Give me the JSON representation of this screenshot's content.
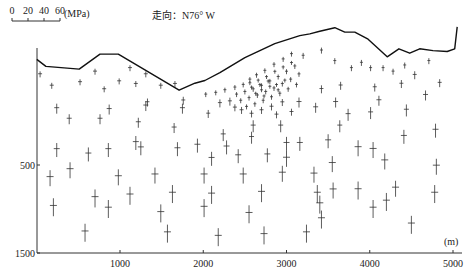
{
  "chart_data": {
    "type": "scatter",
    "title": "",
    "strike_label": "走向：N76° W",
    "scale_bar": {
      "ticks": [
        "0",
        "20",
        "40",
        "60"
      ],
      "unit": "(MPa)",
      "max": 60
    },
    "xlabel": "(m)",
    "ylabel": "",
    "x_ticks": [
      1000,
      2000,
      3000,
      4000,
      5000
    ],
    "x_tick_labels": [
      "1000",
      "2000",
      "3000",
      "4000",
      "5000"
    ],
    "y_ticks": [
      500,
      1500
    ],
    "y_tick_labels": [
      "500",
      "1500"
    ],
    "xlim": [
      0,
      5150
    ],
    "ylim": [
      -830,
      1500
    ],
    "topography": [
      [
        0,
        -700
      ],
      [
        110,
        -620
      ],
      [
        510,
        -590
      ],
      [
        760,
        -760
      ],
      [
        980,
        -760
      ],
      [
        1710,
        -350
      ],
      [
        1900,
        -430
      ],
      [
        2020,
        -460
      ],
      [
        2200,
        -550
      ],
      [
        2500,
        -720
      ],
      [
        2860,
        -880
      ],
      [
        3160,
        -970
      ],
      [
        3280,
        -990
      ],
      [
        3400,
        -1020
      ],
      [
        3580,
        -1060
      ],
      [
        3700,
        -1010
      ],
      [
        3820,
        -1010
      ],
      [
        3980,
        -930
      ],
      [
        4210,
        -730
      ],
      [
        4350,
        -820
      ],
      [
        4480,
        -770
      ],
      [
        4600,
        -820
      ],
      [
        4760,
        -800
      ],
      [
        4930,
        -790
      ],
      [
        5020,
        -820
      ],
      [
        5050,
        -1070
      ]
    ],
    "stress_crosses": [
      {
        "x": 40,
        "y": -530,
        "v": 6,
        "h": 4
      },
      {
        "x": 180,
        "y": -400,
        "v": 6,
        "h": 4
      },
      {
        "x": 520,
        "y": -440,
        "v": 6,
        "h": 4
      },
      {
        "x": 810,
        "y": -360,
        "v": 6,
        "h": 4
      },
      {
        "x": 990,
        "y": -450,
        "v": 6,
        "h": 4
      },
      {
        "x": 1190,
        "y": -420,
        "v": 6,
        "h": 4
      },
      {
        "x": 1490,
        "y": -400,
        "v": 6,
        "h": 4
      },
      {
        "x": 1660,
        "y": -420,
        "v": 6,
        "h": 4
      },
      {
        "x": 1310,
        "y": -530,
        "v": 6,
        "h": 4
      },
      {
        "x": 1120,
        "y": -600,
        "v": 6,
        "h": 4
      },
      {
        "x": 700,
        "y": -560,
        "v": 6,
        "h": 4
      },
      {
        "x": 240,
        "y": -140,
        "v": 10,
        "h": 5
      },
      {
        "x": 870,
        "y": -130,
        "v": 10,
        "h": 5
      },
      {
        "x": 1310,
        "y": -170,
        "v": 10,
        "h": 5
      },
      {
        "x": 1750,
        "y": -140,
        "v": 10,
        "h": 5
      },
      {
        "x": 390,
        "y": -20,
        "v": 10,
        "h": 5
      },
      {
        "x": 760,
        "y": -20,
        "v": 10,
        "h": 5
      },
      {
        "x": 1220,
        "y": 20,
        "v": 10,
        "h": 5
      },
      {
        "x": 1650,
        "y": 80,
        "v": 10,
        "h": 5
      },
      {
        "x": 1330,
        "y": -210,
        "v": 8,
        "h": 4
      },
      {
        "x": 1760,
        "y": -230,
        "v": 8,
        "h": 4
      },
      {
        "x": 2060,
        "y": -80,
        "v": 8,
        "h": 4
      },
      {
        "x": 2200,
        "y": -200,
        "v": 8,
        "h": 4
      },
      {
        "x": 2320,
        "y": -220,
        "v": 8,
        "h": 4
      },
      {
        "x": 240,
        "y": 330,
        "v": 14,
        "h": 6
      },
      {
        "x": 860,
        "y": 330,
        "v": 14,
        "h": 6
      },
      {
        "x": 1250,
        "y": 310,
        "v": 14,
        "h": 6
      },
      {
        "x": 1690,
        "y": 320,
        "v": 14,
        "h": 6
      },
      {
        "x": 1190,
        "y": 250,
        "v": 14,
        "h": 6
      },
      {
        "x": 620,
        "y": 380,
        "v": 14,
        "h": 6
      },
      {
        "x": 1930,
        "y": 280,
        "v": 14,
        "h": 6
      },
      {
        "x": 2280,
        "y": 300,
        "v": 14,
        "h": 6
      },
      {
        "x": 400,
        "y": 560,
        "v": 16,
        "h": 7
      },
      {
        "x": 2100,
        "y": 430,
        "v": 14,
        "h": 6
      },
      {
        "x": 2420,
        "y": 400,
        "v": 14,
        "h": 6
      },
      {
        "x": 2770,
        "y": 390,
        "v": 14,
        "h": 6
      },
      {
        "x": 3000,
        "y": 260,
        "v": 14,
        "h": 6
      },
      {
        "x": 3160,
        "y": 260,
        "v": 14,
        "h": 6
      },
      {
        "x": 3500,
        "y": 230,
        "v": 14,
        "h": 6
      },
      {
        "x": 2580,
        "y": 190,
        "v": 12,
        "h": 5
      },
      {
        "x": 2240,
        "y": 160,
        "v": 12,
        "h": 5
      },
      {
        "x": 2600,
        "y": 60,
        "v": 12,
        "h": 5
      },
      {
        "x": 2930,
        "y": 60,
        "v": 12,
        "h": 5
      },
      {
        "x": 3640,
        "y": 60,
        "v": 12,
        "h": 5
      },
      {
        "x": 3740,
        "y": -70,
        "v": 12,
        "h": 5
      },
      {
        "x": 4010,
        "y": -90,
        "v": 12,
        "h": 5
      },
      {
        "x": 4440,
        "y": -120,
        "v": 12,
        "h": 5
      },
      {
        "x": 3150,
        "y": -210,
        "v": 10,
        "h": 5
      },
      {
        "x": 3350,
        "y": -150,
        "v": 10,
        "h": 5
      },
      {
        "x": 3590,
        "y": -210,
        "v": 10,
        "h": 5
      },
      {
        "x": 4110,
        "y": -230,
        "v": 10,
        "h": 5
      },
      {
        "x": 4670,
        "y": -290,
        "v": 10,
        "h": 5
      },
      {
        "x": 3420,
        "y": -360,
        "v": 8,
        "h": 4
      },
      {
        "x": 3650,
        "y": -400,
        "v": 8,
        "h": 4
      },
      {
        "x": 4060,
        "y": -380,
        "v": 8,
        "h": 4
      },
      {
        "x": 4380,
        "y": -420,
        "v": 8,
        "h": 4
      },
      {
        "x": 4540,
        "y": -520,
        "v": 8,
        "h": 4
      },
      {
        "x": 4840,
        "y": -430,
        "v": 8,
        "h": 4
      },
      {
        "x": 3200,
        "y": -740,
        "v": 6,
        "h": 3
      },
      {
        "x": 3420,
        "y": -800,
        "v": 6,
        "h": 3
      },
      {
        "x": 3580,
        "y": -680,
        "v": 6,
        "h": 3
      },
      {
        "x": 3780,
        "y": -600,
        "v": 6,
        "h": 3
      },
      {
        "x": 3900,
        "y": -660,
        "v": 6,
        "h": 3
      },
      {
        "x": 4010,
        "y": -600,
        "v": 6,
        "h": 3
      },
      {
        "x": 4160,
        "y": -600,
        "v": 6,
        "h": 3
      },
      {
        "x": 4280,
        "y": -560,
        "v": 6,
        "h": 3
      },
      {
        "x": 4420,
        "y": -630,
        "v": 6,
        "h": 3
      },
      {
        "x": 4710,
        "y": -680,
        "v": 6,
        "h": 3
      },
      {
        "x": 2030,
        "y": -300,
        "v": 5,
        "h": 3
      },
      {
        "x": 2150,
        "y": -320,
        "v": 5,
        "h": 3
      },
      {
        "x": 2260,
        "y": -350,
        "v": 5,
        "h": 3
      },
      {
        "x": 2380,
        "y": -380,
        "v": 5,
        "h": 3
      },
      {
        "x": 2480,
        "y": -410,
        "v": 5,
        "h": 3
      },
      {
        "x": 2560,
        "y": -470,
        "v": 5,
        "h": 3
      },
      {
        "x": 2640,
        "y": -520,
        "v": 5,
        "h": 3
      },
      {
        "x": 2740,
        "y": -570,
        "v": 5,
        "h": 3
      },
      {
        "x": 2850,
        "y": -640,
        "v": 5,
        "h": 3
      },
      {
        "x": 2960,
        "y": -700,
        "v": 5,
        "h": 3
      },
      {
        "x": 3060,
        "y": -760,
        "v": 5,
        "h": 3
      },
      {
        "x": 2400,
        "y": -300,
        "v": 5,
        "h": 3
      },
      {
        "x": 2500,
        "y": -330,
        "v": 5,
        "h": 3
      },
      {
        "x": 2600,
        "y": -360,
        "v": 5,
        "h": 3
      },
      {
        "x": 2700,
        "y": -400,
        "v": 5,
        "h": 3
      },
      {
        "x": 2800,
        "y": -450,
        "v": 5,
        "h": 3
      },
      {
        "x": 2900,
        "y": -500,
        "v": 5,
        "h": 3
      },
      {
        "x": 3000,
        "y": -560,
        "v": 5,
        "h": 3
      },
      {
        "x": 3100,
        "y": -620,
        "v": 5,
        "h": 3
      },
      {
        "x": 2450,
        "y": -230,
        "v": 5,
        "h": 3
      },
      {
        "x": 2550,
        "y": -260,
        "v": 5,
        "h": 3
      },
      {
        "x": 2650,
        "y": -290,
        "v": 5,
        "h": 3
      },
      {
        "x": 2750,
        "y": -330,
        "v": 5,
        "h": 3
      },
      {
        "x": 2850,
        "y": -370,
        "v": 5,
        "h": 3
      },
      {
        "x": 2950,
        "y": -420,
        "v": 5,
        "h": 3
      },
      {
        "x": 3050,
        "y": -470,
        "v": 5,
        "h": 3
      },
      {
        "x": 3150,
        "y": -530,
        "v": 5,
        "h": 3
      },
      {
        "x": 2520,
        "y": -160,
        "v": 5,
        "h": 3
      },
      {
        "x": 2620,
        "y": -190,
        "v": 5,
        "h": 3
      },
      {
        "x": 2720,
        "y": -230,
        "v": 5,
        "h": 3
      },
      {
        "x": 2820,
        "y": -270,
        "v": 5,
        "h": 3
      },
      {
        "x": 2920,
        "y": -310,
        "v": 5,
        "h": 3
      },
      {
        "x": 3020,
        "y": -360,
        "v": 5,
        "h": 3
      },
      {
        "x": 3120,
        "y": -410,
        "v": 5,
        "h": 3
      },
      {
        "x": 2560,
        "y": -430,
        "v": 4,
        "h": 3
      },
      {
        "x": 2660,
        "y": -460,
        "v": 4,
        "h": 3
      },
      {
        "x": 2760,
        "y": -500,
        "v": 4,
        "h": 3
      },
      {
        "x": 2860,
        "y": -560,
        "v": 4,
        "h": 3
      },
      {
        "x": 2960,
        "y": -610,
        "v": 4,
        "h": 3
      },
      {
        "x": 3060,
        "y": -660,
        "v": 4,
        "h": 3
      },
      {
        "x": 2580,
        "y": -380,
        "v": 4,
        "h": 3
      },
      {
        "x": 2680,
        "y": -410,
        "v": 4,
        "h": 3
      },
      {
        "x": 2780,
        "y": -450,
        "v": 4,
        "h": 3
      },
      {
        "x": 2880,
        "y": -410,
        "v": 4,
        "h": 3
      },
      {
        "x": 2980,
        "y": -460,
        "v": 4,
        "h": 3
      },
      {
        "x": 2700,
        "y": -350,
        "v": 4,
        "h": 3
      },
      {
        "x": 2800,
        "y": -390,
        "v": 4,
        "h": 3
      },
      {
        "x": 2900,
        "y": -350,
        "v": 4,
        "h": 3
      },
      {
        "x": 2630,
        "y": -310,
        "v": 4,
        "h": 3
      },
      {
        "x": 2730,
        "y": -280,
        "v": 4,
        "h": 3
      },
      {
        "x": 2460,
        "y": -120,
        "v": 7,
        "h": 4
      },
      {
        "x": 2580,
        "y": -80,
        "v": 7,
        "h": 4
      },
      {
        "x": 2700,
        "y": -120,
        "v": 7,
        "h": 4
      },
      {
        "x": 2820,
        "y": -160,
        "v": 7,
        "h": 4
      },
      {
        "x": 2950,
        "y": -210,
        "v": 7,
        "h": 4
      },
      {
        "x": 2880,
        "y": -70,
        "v": 7,
        "h": 4
      },
      {
        "x": 3060,
        "y": -100,
        "v": 7,
        "h": 4
      },
      {
        "x": 2380,
        "y": -150,
        "v": 7,
        "h": 4
      },
      {
        "x": 200,
        "y": 980,
        "v": 18,
        "h": 7
      },
      {
        "x": 700,
        "y": 880,
        "v": 18,
        "h": 7
      },
      {
        "x": 1120,
        "y": 850,
        "v": 18,
        "h": 7
      },
      {
        "x": 1630,
        "y": 830,
        "v": 18,
        "h": 7
      },
      {
        "x": 2100,
        "y": 840,
        "v": 18,
        "h": 7
      },
      {
        "x": 2700,
        "y": 820,
        "v": 18,
        "h": 7
      },
      {
        "x": 3370,
        "y": 830,
        "v": 18,
        "h": 7
      },
      {
        "x": 3860,
        "y": 790,
        "v": 18,
        "h": 7
      },
      {
        "x": 4780,
        "y": 830,
        "v": 18,
        "h": 7
      },
      {
        "x": 860,
        "y": 1000,
        "v": 18,
        "h": 7
      },
      {
        "x": 1490,
        "y": 1050,
        "v": 18,
        "h": 7
      },
      {
        "x": 2010,
        "y": 990,
        "v": 18,
        "h": 7
      },
      {
        "x": 3400,
        "y": 950,
        "v": 18,
        "h": 7
      },
      {
        "x": 4200,
        "y": 920,
        "v": 18,
        "h": 7
      },
      {
        "x": 2550,
        "y": 1060,
        "v": 18,
        "h": 7
      },
      {
        "x": 580,
        "y": 1270,
        "v": 18,
        "h": 7
      },
      {
        "x": 1570,
        "y": 1280,
        "v": 18,
        "h": 7
      },
      {
        "x": 2180,
        "y": 1320,
        "v": 18,
        "h": 7
      },
      {
        "x": 2730,
        "y": 1300,
        "v": 18,
        "h": 7
      },
      {
        "x": 3240,
        "y": 1280,
        "v": 18,
        "h": 7
      },
      {
        "x": 3420,
        "y": 1120,
        "v": 18,
        "h": 7
      },
      {
        "x": 4040,
        "y": 1000,
        "v": 18,
        "h": 7
      },
      {
        "x": 4500,
        "y": 1180,
        "v": 18,
        "h": 7
      },
      {
        "x": 4800,
        "y": 520,
        "v": 16,
        "h": 7
      },
      {
        "x": 4790,
        "y": 110,
        "v": 14,
        "h": 6
      },
      {
        "x": 3860,
        "y": 310,
        "v": 16,
        "h": 7
      },
      {
        "x": 4040,
        "y": 330,
        "v": 16,
        "h": 7
      },
      {
        "x": 4410,
        "y": 180,
        "v": 14,
        "h": 6
      },
      {
        "x": 3550,
        "y": 490,
        "v": 16,
        "h": 7
      },
      {
        "x": 3560,
        "y": 790,
        "v": 16,
        "h": 7
      },
      {
        "x": 4310,
        "y": 770,
        "v": 16,
        "h": 7
      },
      {
        "x": 3330,
        "y": 610,
        "v": 16,
        "h": 7
      },
      {
        "x": 2950,
        "y": 600,
        "v": 16,
        "h": 7
      },
      {
        "x": 2480,
        "y": 620,
        "v": 16,
        "h": 7
      },
      {
        "x": 2010,
        "y": 620,
        "v": 16,
        "h": 7
      },
      {
        "x": 1420,
        "y": 620,
        "v": 16,
        "h": 7
      },
      {
        "x": 980,
        "y": 640,
        "v": 16,
        "h": 7
      },
      {
        "x": 160,
        "y": 650,
        "v": 16,
        "h": 7
      },
      {
        "x": 4180,
        "y": 460,
        "v": 16,
        "h": 7
      },
      {
        "x": 3000,
        "y": 430,
        "v": 16,
        "h": 7
      }
    ]
  }
}
